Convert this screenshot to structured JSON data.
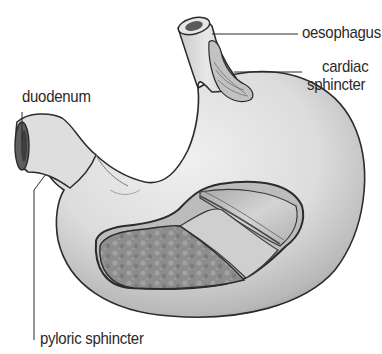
{
  "diagram": {
    "labels": {
      "oesophagus": "oesophagus",
      "cardiac_line1": "cardiac",
      "cardiac_line2": "sphincter",
      "duodenum": "duodenum",
      "pyloric": "pyloric sphincter"
    },
    "colors": {
      "outline": "#2b2b2b",
      "body_light": "#e6e6e6",
      "body_mid": "#c4c4c4",
      "body_dark": "#8a8a8a",
      "lining_dark": "#7a7a7a",
      "muscle_band": "#bdbdbd",
      "text": "#2a2a2a"
    }
  }
}
